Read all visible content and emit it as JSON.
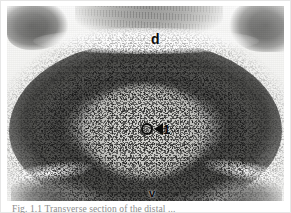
{
  "figure": {
    "kind": "histological-micrograph",
    "plate_background_color": "#f2f2f0",
    "ink_color": "#0d0d0d",
    "caption_color": "#8d8d8d",
    "caption_text": "Fig. 1.1  Transverse section of the distal ...",
    "annotations": {
      "dorsal_label": "d",
      "ventral_label": "v",
      "numeric_label": "1",
      "ring_marker": "open-circle-marker",
      "arrow_marker": "left-pointing-arrowhead"
    },
    "regions": {
      "dorsal_cleft": "dorsal-cleft",
      "grey_matter": "dense-dark-tissue-ring",
      "medulla_core": "pale-central-core",
      "top_left_tissue": "dark-tissue-blob",
      "top_mid_tissue": "striated-tissue",
      "top_right_tissue": "dark-tissue-blob",
      "bottom_left_tissue": "dark-tissue-blob",
      "bottom_right_tissue": "dark-tissue-blob"
    }
  }
}
